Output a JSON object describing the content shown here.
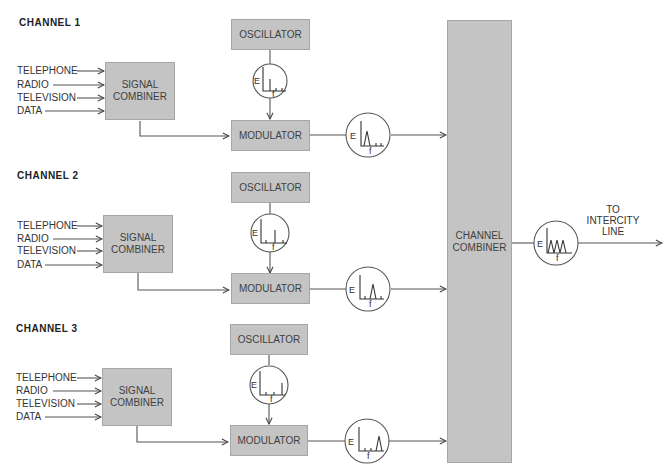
{
  "diagram": {
    "colors": {
      "box_fill": "#c4c4c4",
      "box_border": "#a6a6a6",
      "line": "#555555",
      "text": "#333333"
    },
    "channels": [
      {
        "title": "CHANNEL 1",
        "inputs": [
          "TELEPHONE",
          "RADIO",
          "TELEVISION",
          "DATA"
        ],
        "signal_combiner": "SIGNAL COMBINER",
        "oscillator": "OSCILLATOR",
        "modulator": "MODULATOR",
        "oscillator_spectrum": {
          "axis_e": "E",
          "axis_f": "f",
          "peak_position": "low"
        },
        "modulated_spectrum": {
          "axis_e": "E",
          "axis_f": "f",
          "peak_position": "low"
        }
      },
      {
        "title": "CHANNEL 2",
        "inputs": [
          "TELEPHONE",
          "RADIO",
          "TELEVISION",
          "DATA"
        ],
        "signal_combiner": "SIGNAL COMBINER",
        "oscillator": "OSCILLATOR",
        "modulator": "MODULATOR",
        "oscillator_spectrum": {
          "axis_e": "E",
          "axis_f": "f",
          "peak_position": "middle"
        },
        "modulated_spectrum": {
          "axis_e": "E",
          "axis_f": "f",
          "peak_position": "middle"
        }
      },
      {
        "title": "CHANNEL 3",
        "inputs": [
          "TELEPHONE",
          "RADIO",
          "TELEVISION",
          "DATA"
        ],
        "signal_combiner": "SIGNAL COMBINER",
        "oscillator": "OSCILLATOR",
        "modulator": "MODULATOR",
        "oscillator_spectrum": {
          "axis_e": "E",
          "axis_f": "f",
          "peak_position": "high"
        },
        "modulated_spectrum": {
          "axis_e": "E",
          "axis_f": "f",
          "peak_position": "high"
        }
      }
    ],
    "channel_combiner": "CHANNEL COMBINER",
    "combined_spectrum": {
      "axis_e": "E",
      "axis_f": "f",
      "peaks": 3
    },
    "output_label": "TO INTERCITY LINE"
  }
}
